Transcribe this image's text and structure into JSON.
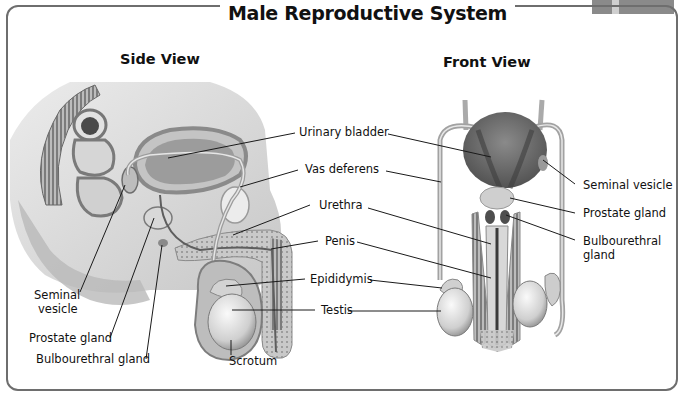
{
  "title": "Male Reproductive System",
  "views": {
    "side": {
      "title": "Side View",
      "labels": {
        "urinary_bladder": "Urinary bladder",
        "vas_deferens": "Vas deferens",
        "urethra": "Urethra",
        "penis": "Penis",
        "epididymis": "Epididymis",
        "testis": "Testis",
        "seminal_vesicle_line1": "Seminal",
        "seminal_vesicle_line2": "vesicle",
        "prostate_gland": "Prostate gland",
        "bulbourethral_gland": "Bulbourethral gland",
        "scrotum": "Scrotum"
      }
    },
    "front": {
      "title": "Front View",
      "labels": {
        "seminal_vesicle": "Seminal vesicle",
        "prostate_gland": "Prostate gland",
        "bulbourethral_line1": "Bulbourethral",
        "bulbourethral_line2": "gland"
      }
    }
  },
  "colors": {
    "frame": "#6e6e6e",
    "leader_line": "#1a1a1a",
    "organ_dark": "#6a6a6a",
    "organ_mid": "#a8a8a8",
    "organ_light": "#dedede"
  }
}
